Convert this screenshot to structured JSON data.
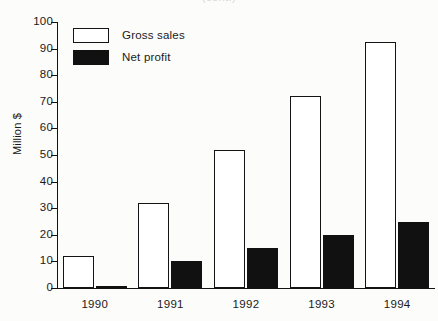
{
  "chart_data": {
    "type": "bar",
    "title": "(cont.)",
    "xlabel": "",
    "ylabel": "Million $",
    "categories": [
      "1990",
      "1991",
      "1992",
      "1993",
      "1994"
    ],
    "series": [
      {
        "name": "Gross sales",
        "values": [
          12,
          32,
          52,
          72,
          92.5
        ],
        "fill": "#ffffff",
        "edge": "#141414"
      },
      {
        "name": "Net profit",
        "values": [
          0.5,
          10,
          15,
          20,
          25
        ],
        "fill": "#111111",
        "edge": "#111111"
      }
    ],
    "ylim": [
      0,
      100
    ],
    "yticks": [
      0,
      10,
      20,
      30,
      40,
      50,
      60,
      70,
      80,
      90,
      100
    ],
    "ytick_labels": [
      "0",
      "10",
      "20",
      "30",
      "40",
      "50",
      "60",
      "70",
      "80",
      "90",
      "100"
    ],
    "grid": false,
    "legend_position": "upper left"
  },
  "colors": {
    "background": "#fcfcfa",
    "axis": "#121212",
    "gross_fill": "#ffffff",
    "net_fill": "#111111"
  }
}
